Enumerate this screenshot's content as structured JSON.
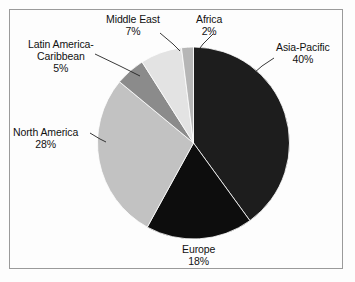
{
  "chart_data": {
    "type": "pie",
    "title": "",
    "subtitle": "",
    "xlabel": "",
    "ylabel": "",
    "legend_position": "none",
    "labels_position": "outside-with-leader-lines",
    "grid": false,
    "start_angle_deg": 0,
    "direction": "clockwise",
    "categories": [
      "Asia-Pacific",
      "Europe",
      "North America",
      "Latin America-Caribbean",
      "Middle East",
      "Africa"
    ],
    "values": [
      40,
      18,
      28,
      5,
      7,
      2
    ],
    "value_unit": "%",
    "slices": [
      {
        "name": "Asia-Pacific",
        "value": 40,
        "percent_text": "40%",
        "color": "#1d1d1d",
        "label_lines": [
          "Asia-Pacific",
          "40%"
        ]
      },
      {
        "name": "Europe",
        "value": 18,
        "percent_text": "18%",
        "color": "#0d0d0d",
        "label_lines": [
          "Europe",
          "18%"
        ]
      },
      {
        "name": "North America",
        "value": 28,
        "percent_text": "28%",
        "color": "#c2c2c2",
        "label_lines": [
          "North America",
          "28%"
        ]
      },
      {
        "name": "Latin America-Caribbean",
        "value": 5,
        "percent_text": "5%",
        "color": "#8b8b8b",
        "label_lines": [
          "Latin America-",
          "Caribbean",
          "5%"
        ]
      },
      {
        "name": "Middle East",
        "value": 7,
        "percent_text": "7%",
        "color": "#e3e3e3",
        "label_lines": [
          "Middle East",
          "7%"
        ]
      },
      {
        "name": "Africa",
        "value": 2,
        "percent_text": "2%",
        "color": "#b6b6b6",
        "label_lines": [
          "Africa",
          "2%"
        ]
      }
    ]
  },
  "labels": {
    "africa": {
      "name": "Africa",
      "pct": "2%"
    },
    "asia_pacific": {
      "name": "Asia-Pacific",
      "pct": "40%"
    },
    "europe": {
      "name": "Europe",
      "pct": "18%"
    },
    "north_america": {
      "name": "North America",
      "pct": "28%"
    },
    "latin_america": {
      "line1": "Latin America-",
      "line2": "Caribbean",
      "pct": "5%"
    },
    "middle_east": {
      "name": "Middle East",
      "pct": "7%"
    }
  },
  "style": {
    "background": "#fdfdfd",
    "border_color": "#9a9a9a",
    "text_color": "#111111",
    "slice_outline": "#ffffff"
  }
}
